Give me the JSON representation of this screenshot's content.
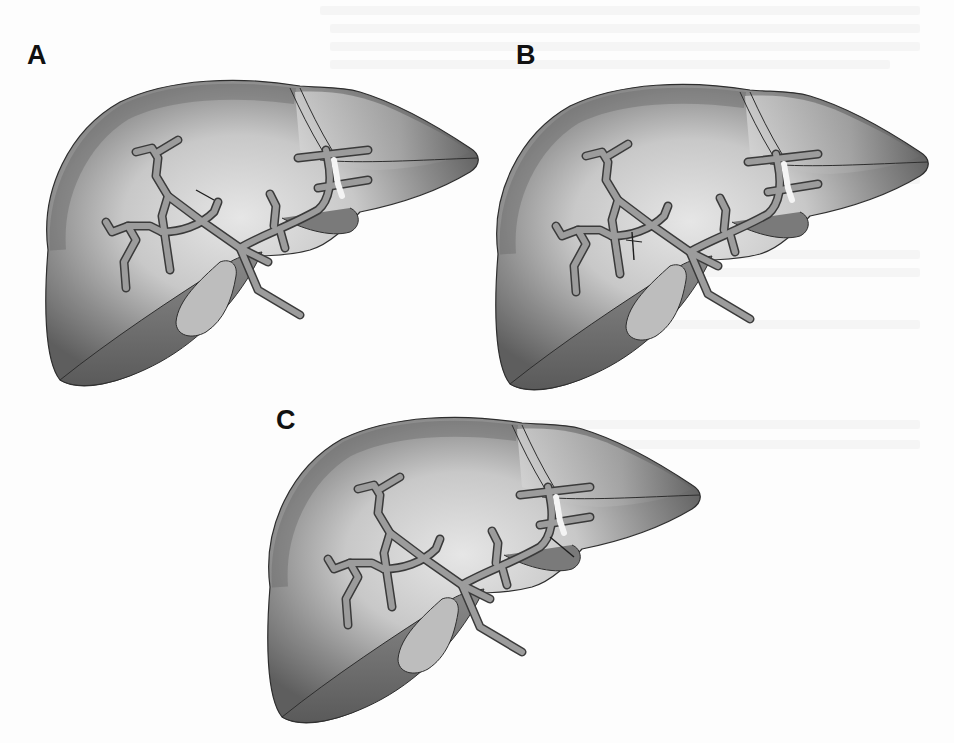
{
  "figure": {
    "panels": [
      {
        "id": "A",
        "label": "A",
        "transection": "short mark at the upper right-anterior sectoral duct near the hilum"
      },
      {
        "id": "B",
        "label": "B",
        "transection": "mark across the right posterior sectoral duct"
      },
      {
        "id": "C",
        "label": "C",
        "transection": "mark along the left lateral side below the left hepatic duct branches"
      }
    ],
    "colors": {
      "background": "#fdfdfd",
      "parenchyma_dark": "#5c5c5c",
      "parenchyma_mid": "#8a8a8a",
      "parenchyma_light": "#cfcfcf",
      "duct_fill": "#9a9a9a",
      "duct_outline": "#3a3a3a",
      "gallbladder": "#b8b8b8",
      "label": "#111111"
    }
  }
}
